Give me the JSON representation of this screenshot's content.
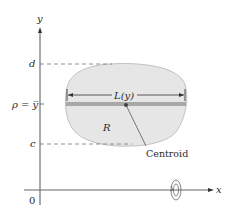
{
  "figure": {
    "axes": {
      "x_label": "x",
      "y_label": "y",
      "origin_label": "0"
    },
    "levels": {
      "d_label": "d",
      "rho_label": "ρ = y̅",
      "c_label": "c"
    },
    "region": {
      "label": "R",
      "fill_color": "#e6e6e6",
      "stroke_color": "#b0b0b0"
    },
    "length_label": "L(y)",
    "centroid_label": "Centroid",
    "band_color": "#a8a8a8",
    "axis_color": "#555555",
    "revolution_symbol": "rotation-about-x-axis-icon"
  }
}
